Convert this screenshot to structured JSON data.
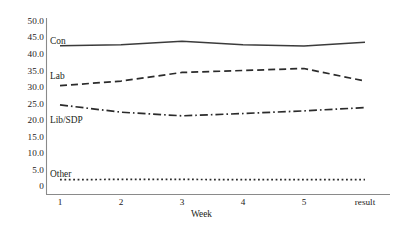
{
  "chart_data": {
    "type": "line",
    "title": "",
    "xlabel": "Week",
    "ylabel": "",
    "categories": [
      "1",
      "2",
      "3",
      "4",
      "5",
      "result"
    ],
    "ylim": [
      0,
      50
    ],
    "yticks": [
      "0",
      "5.0",
      "10.0",
      "15.0",
      "20.0",
      "25.0",
      "30.0",
      "35.0",
      "40.0",
      "45.0",
      "50.0"
    ],
    "ytick_values": [
      0,
      5,
      10,
      15,
      20,
      25,
      30,
      35,
      40,
      45,
      50
    ],
    "grid": false,
    "legend": "inline-labels-left",
    "series": [
      {
        "name": "Con",
        "style": "solid",
        "color": "#3b3b3b",
        "values": [
          42.7,
          43.0,
          44.0,
          43.0,
          42.6,
          43.7
        ]
      },
      {
        "name": "Lab",
        "style": "dashed",
        "color": "#2b2b2b",
        "values": [
          30.6,
          32.0,
          34.6,
          35.2,
          35.8,
          32.0
        ]
      },
      {
        "name": "Lib/SDP",
        "style": "dash-dot",
        "color": "#2b2b2b",
        "values": [
          24.8,
          22.6,
          21.5,
          22.2,
          23.0,
          24.0
        ]
      },
      {
        "name": "Other",
        "style": "dotted",
        "color": "#2b2b2b",
        "values": [
          2.2,
          2.3,
          2.3,
          2.2,
          2.2,
          2.2
        ]
      }
    ],
    "axis_color": "#7c7c7c"
  }
}
